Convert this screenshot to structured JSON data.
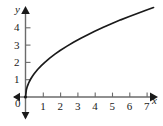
{
  "chart_data": {
    "type": "line",
    "title": "",
    "subtitle": "",
    "xlabel": "x",
    "ylabel": "y",
    "xlim": [
      0,
      7.6
    ],
    "ylim": [
      0,
      5.4
    ],
    "grid": false,
    "legend": null,
    "x_ticks": [
      1,
      2,
      3,
      4,
      5,
      6,
      7
    ],
    "x_tick_labels": [
      "1",
      "2",
      "3",
      "4",
      "5",
      "6",
      "7"
    ],
    "y_ticks": [
      1,
      2,
      3,
      4
    ],
    "y_tick_labels": [
      "1",
      "2",
      "3",
      "4"
    ],
    "origin_label": "0",
    "curve_color": "#1a1a1a",
    "axis_color": "#555555",
    "series": [
      {
        "name": "y = 1.9*sqrt(x)",
        "x": [
          0,
          0.05,
          0.1,
          0.2,
          0.3,
          0.4,
          0.5,
          0.7,
          0.9,
          1.1,
          1.4,
          1.7,
          2.0,
          2.4,
          2.8,
          3.2,
          3.6,
          4.0,
          4.5,
          5.0,
          5.5,
          6.0,
          6.5,
          7.0,
          7.4
        ],
        "y": [
          0,
          0.42,
          0.6,
          0.85,
          1.04,
          1.2,
          1.34,
          1.59,
          1.8,
          1.99,
          2.25,
          2.48,
          2.69,
          2.94,
          3.18,
          3.4,
          3.6,
          3.8,
          4.03,
          4.25,
          4.46,
          4.65,
          4.84,
          5.03,
          5.17
        ]
      }
    ]
  },
  "labels": {
    "x_axis_name": "x",
    "y_axis_name": "y",
    "origin": "0",
    "x1": "1",
    "x2": "2",
    "x3": "3",
    "x4": "4",
    "x5": "5",
    "x6": "6",
    "x7": "7",
    "y1": "1",
    "y2": "2",
    "y3": "3",
    "y4": "4"
  }
}
